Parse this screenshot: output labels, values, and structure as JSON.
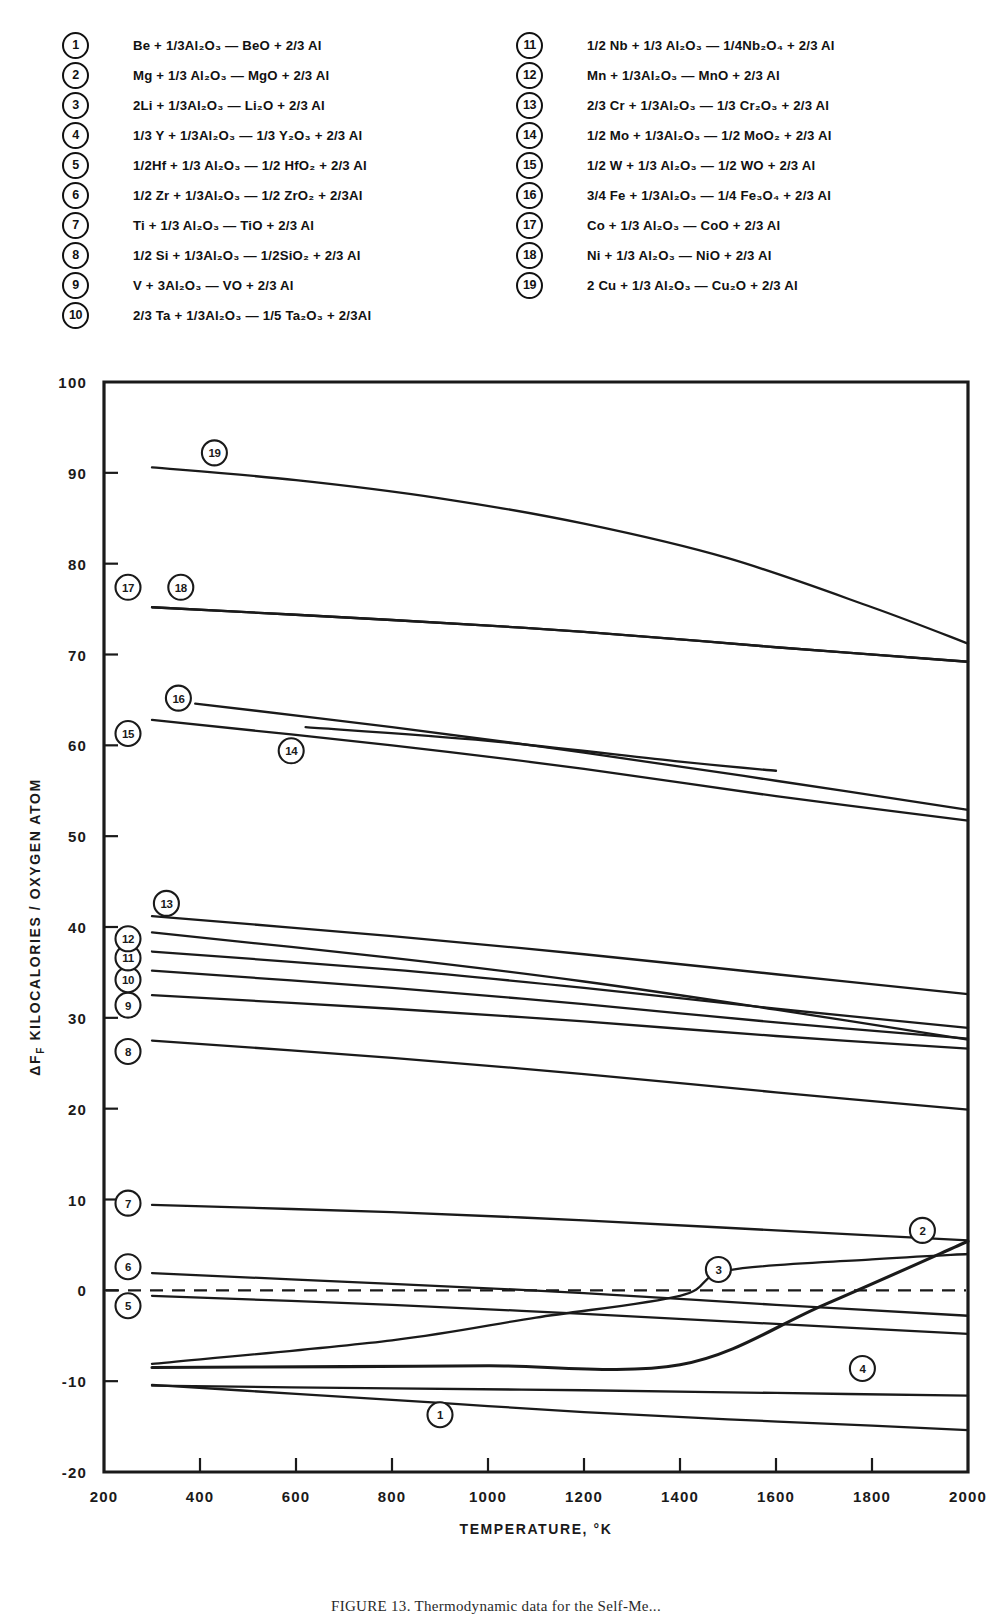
{
  "legend": {
    "left": [
      {
        "num": "1",
        "eq": "Be + 1/3Al₂O₃  —  BeO + 2/3 Al"
      },
      {
        "num": "2",
        "eq": "Mg + 1/3 Al₂O₃ — MgO + 2/3 Al"
      },
      {
        "num": "3",
        "eq": "2Li + 1/3Al₂O₃ — Li₂O + 2/3 Al"
      },
      {
        "num": "4",
        "eq": "1/3 Y + 1/3Al₂O₃  —  1/3 Y₂O₃ + 2/3 Al"
      },
      {
        "num": "5",
        "eq": "1/2Hf + 1/3 Al₂O₃ — 1/2 HfO₂ + 2/3 Al"
      },
      {
        "num": "6",
        "eq": "1/2 Zr + 1/3Al₂O₃ — 1/2 ZrO₂ + 2/3Al"
      },
      {
        "num": "7",
        "eq": "Ti + 1/3 Al₂O₃  —  TiO + 2/3 Al"
      },
      {
        "num": "8",
        "eq": "1/2 Si + 1/3Al₂O₃ — 1/2SiO₂ + 2/3 Al"
      },
      {
        "num": "9",
        "eq": "V + 3Al₂O₃  —  VO + 2/3 Al"
      },
      {
        "num": "10",
        "eq": "2/3 Ta + 1/3Al₂O₃ — 1/5 Ta₂O₃ + 2/3Al"
      }
    ],
    "right": [
      {
        "num": "11",
        "eq": "1/2 Nb + 1/3 Al₂O₃  —  1/4Nb₂O₄ + 2/3 Al"
      },
      {
        "num": "12",
        "eq": "Mn + 1/3Al₂O₃ — MnO + 2/3 Al"
      },
      {
        "num": "13",
        "eq": "2/3 Cr + 1/3Al₂O₃  —  1/3 Cr₂O₃ + 2/3 Al"
      },
      {
        "num": "14",
        "eq": "1/2 Mo + 1/3Al₂O₃  —  1/2 MoO₂ + 2/3 Al"
      },
      {
        "num": "15",
        "eq": "1/2 W + 1/3 Al₂O₃ — 1/2 WO + 2/3 Al"
      },
      {
        "num": "16",
        "eq": "3/4 Fe + 1/3Al₂O₃ — 1/4 Fe₃O₄ + 2/3 Al"
      },
      {
        "num": "17",
        "eq": "Co + 1/3 Al₂O₃  —  CoO + 2/3 Al"
      },
      {
        "num": "18",
        "eq": "Ni + 1/3 Al₂O₃  —  NiO + 2/3 Al"
      },
      {
        "num": "19",
        "eq": "2 Cu + 1/3 Al₂O₃ — Cu₂O + 2/3 Al"
      }
    ]
  },
  "caption": "FIGURE 13.  Thermodynamic data for the Self-Me...",
  "chart_data": {
    "type": "line",
    "title": "",
    "xlabel": "TEMPERATURE, °K",
    "ylabel": "ΔFₑ KILOCALORIES / OXYGEN ATOM",
    "ylabel_parts": {
      "delta": "Δ",
      "f": "F",
      "sub": "F",
      "rest": " KILOCALORIES / OXYGEN ATOM"
    },
    "xlim": [
      200,
      2000
    ],
    "ylim": [
      -20,
      100
    ],
    "xticks": [
      200,
      400,
      600,
      800,
      1000,
      1200,
      1400,
      1600,
      1800,
      2000
    ],
    "yticks": [
      -20,
      -10,
      0,
      10,
      20,
      30,
      40,
      50,
      60,
      70,
      80,
      90,
      100
    ],
    "grid": false,
    "legend_position": "above-plot",
    "zero_reference_line": 0,
    "zero_reference_style": "dashed",
    "series": [
      {
        "name": "1",
        "label": "Be",
        "bold": false,
        "x": [
          300,
          600,
          900,
          1200,
          1500,
          1800,
          2000
        ],
        "y": [
          -10.4,
          -11.4,
          -12.4,
          -13.4,
          -14.2,
          -14.9,
          -15.4
        ],
        "marker": {
          "x": 900,
          "y": -13.7,
          "pos": "below"
        }
      },
      {
        "name": "2",
        "label": "Mg",
        "bold": true,
        "x": [
          300,
          700,
          1000,
          1400,
          1700,
          2000
        ],
        "y": [
          -8.5,
          -8.4,
          -8.3,
          -8.2,
          -1.6,
          5.4
        ],
        "marker": {
          "x": 1905,
          "y": 6.6,
          "pos": "above-left"
        }
      },
      {
        "name": "3",
        "label": "2Li",
        "bold": false,
        "x": [
          300,
          800,
          1100,
          1400,
          1500,
          1800,
          2000
        ],
        "y": [
          -8.1,
          -5.5,
          -3.0,
          -0.6,
          2.2,
          3.4,
          4.0
        ],
        "marker": {
          "x": 1480,
          "y": 2.3,
          "pos": "right"
        }
      },
      {
        "name": "4",
        "label": "1/3 Y",
        "bold": false,
        "x": [
          300,
          800,
          1200,
          1600,
          2000
        ],
        "y": [
          -10.5,
          -10.8,
          -11.0,
          -11.3,
          -11.6
        ],
        "marker": {
          "x": 1780,
          "y": -8.6,
          "pos": "above"
        }
      },
      {
        "name": "5",
        "label": "1/2 Hf",
        "bold": false,
        "x": [
          300,
          800,
          1200,
          1600,
          2000
        ],
        "y": [
          -0.6,
          -1.6,
          -2.6,
          -3.7,
          -4.8
        ],
        "marker": {
          "x": 250,
          "y": -1.7,
          "pos": "left"
        }
      },
      {
        "name": "6",
        "label": "1/2 Zr",
        "bold": false,
        "x": [
          300,
          800,
          1200,
          1600,
          2000
        ],
        "y": [
          1.9,
          0.7,
          -0.3,
          -1.6,
          -2.8
        ],
        "marker": {
          "x": 250,
          "y": 2.6,
          "pos": "left"
        }
      },
      {
        "name": "7",
        "label": "Ti",
        "bold": false,
        "x": [
          300,
          800,
          1200,
          1600,
          2000
        ],
        "y": [
          9.4,
          8.6,
          7.7,
          6.6,
          5.5
        ],
        "marker": {
          "x": 250,
          "y": 9.6,
          "pos": "left"
        }
      },
      {
        "name": "8",
        "label": "1/2 Si",
        "bold": false,
        "x": [
          300,
          800,
          1200,
          1600,
          2000
        ],
        "y": [
          27.5,
          25.6,
          23.8,
          21.8,
          19.9
        ],
        "marker": {
          "x": 250,
          "y": 26.3,
          "pos": "left"
        }
      },
      {
        "name": "9",
        "label": "V",
        "bold": false,
        "x": [
          300,
          800,
          1200,
          1600,
          2000
        ],
        "y": [
          32.5,
          31.0,
          29.6,
          28.0,
          26.6
        ],
        "marker": {
          "x": 250,
          "y": 31.4,
          "pos": "left"
        }
      },
      {
        "name": "10",
        "label": "2/3 Ta",
        "bold": false,
        "x": [
          300,
          800,
          1200,
          1600,
          2000
        ],
        "y": [
          35.2,
          33.3,
          31.5,
          29.5,
          27.7
        ],
        "marker": {
          "x": 250,
          "y": 34.2,
          "pos": "left"
        }
      },
      {
        "name": "11",
        "label": "1/2 Nb",
        "bold": false,
        "x": [
          300,
          800,
          1200,
          1600,
          2000
        ],
        "y": [
          37.3,
          35.3,
          33.3,
          31.0,
          28.9
        ],
        "marker": {
          "x": 250,
          "y": 36.6,
          "pos": "left"
        }
      },
      {
        "name": "12",
        "label": "Mn",
        "bold": false,
        "x": [
          300,
          800,
          1200,
          1600,
          2000
        ],
        "y": [
          39.4,
          36.6,
          34.0,
          30.9,
          27.6
        ],
        "marker": {
          "x": 250,
          "y": 38.7,
          "pos": "left"
        }
      },
      {
        "name": "13",
        "label": "2/3 Cr",
        "bold": false,
        "x": [
          300,
          800,
          1200,
          1600,
          2000
        ],
        "y": [
          41.2,
          39.0,
          37.0,
          34.8,
          32.6
        ],
        "marker": {
          "x": 330,
          "y": 42.6,
          "pos": "above"
        }
      },
      {
        "name": "14",
        "label": "1/2 Mo",
        "bold": false,
        "x": [
          620,
          1000,
          1400,
          1600
        ],
        "y": [
          62.0,
          60.5,
          58.2,
          57.2
        ],
        "marker": {
          "x": 590,
          "y": 59.4,
          "pos": "below"
        }
      },
      {
        "name": "15",
        "label": "1/2 W",
        "bold": false,
        "x": [
          300,
          800,
          1200,
          1600,
          2000
        ],
        "y": [
          62.8,
          60.0,
          57.4,
          54.4,
          51.7
        ],
        "marker": {
          "x": 250,
          "y": 61.3,
          "pos": "left"
        }
      },
      {
        "name": "16",
        "label": "3/4 Fe",
        "bold": false,
        "x": [
          390,
          800,
          1200,
          1600,
          2000
        ],
        "y": [
          64.6,
          62.0,
          59.2,
          56.1,
          52.9
        ],
        "marker": {
          "x": 355,
          "y": 65.2,
          "pos": "above"
        }
      },
      {
        "name": "17",
        "label": "Co",
        "bold": false,
        "x": [
          300,
          800,
          1200,
          1600,
          2000
        ],
        "y": [
          75.2,
          73.8,
          72.5,
          70.8,
          69.2
        ],
        "marker": {
          "x": 250,
          "y": 77.4,
          "pos": "above"
        }
      },
      {
        "name": "18",
        "label": "Ni",
        "bold": false,
        "x": [
          300,
          800,
          1200,
          1600,
          2000
        ],
        "y": [
          75.2,
          73.8,
          72.5,
          70.8,
          69.2
        ],
        "marker": {
          "x": 360,
          "y": 77.4,
          "pos": "above"
        }
      },
      {
        "name": "19",
        "label": "2 Cu",
        "bold": false,
        "x": [
          300,
          600,
          900,
          1200,
          1500,
          1800,
          2000
        ],
        "y": [
          90.6,
          89.2,
          87.2,
          84.4,
          80.6,
          75.2,
          71.2
        ],
        "marker": {
          "x": 430,
          "y": 92.2,
          "pos": "above"
        }
      }
    ]
  }
}
